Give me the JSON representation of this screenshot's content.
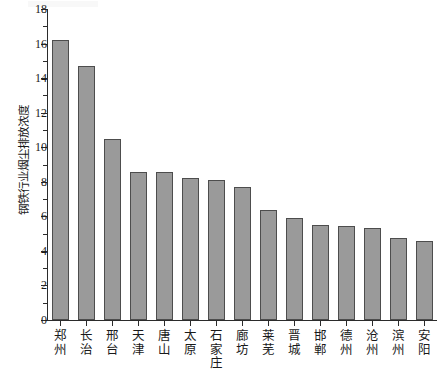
{
  "chart_data": {
    "type": "bar",
    "title": "",
    "xlabel": "",
    "ylabel": "钢铁行业烟尘排放浓度",
    "ylim": [
      0,
      18
    ],
    "ytick_step": 2,
    "yticks": [
      0,
      2,
      4,
      6,
      8,
      10,
      12,
      14,
      16,
      18
    ],
    "ytick_labels": [
      "0",
      "2",
      "4",
      "6",
      "8",
      "10",
      "12",
      "14",
      "16",
      "18"
    ],
    "minor_ticks": true,
    "grid": false,
    "legend": null,
    "bar_color": "#9a9a9a",
    "bar_edge_color": "#4d4d4d",
    "axis_color": "#2b2b2b",
    "categories": [
      "郑州",
      "长治",
      "邢台",
      "天津",
      "唐山",
      "太原",
      "石家庄",
      "廊坊",
      "莱芜",
      "晋城",
      "邯郸",
      "德州",
      "沧州",
      "滨州",
      "安阳"
    ],
    "values": [
      16.2,
      14.7,
      10.5,
      8.55,
      8.55,
      8.2,
      8.1,
      7.7,
      6.35,
      5.9,
      5.5,
      5.45,
      5.35,
      4.75,
      4.6
    ]
  }
}
